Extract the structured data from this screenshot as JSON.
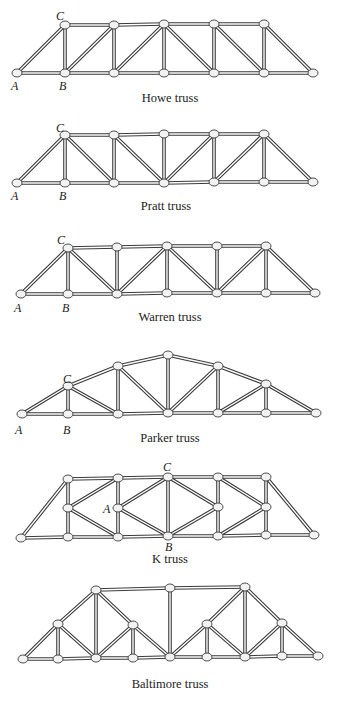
{
  "figure": {
    "trusses": [
      {
        "name": "Howe truss",
        "title_pos": [
          170,
          92
        ],
        "labels": [
          {
            "text": "C",
            "x": 56,
            "y": 10
          },
          {
            "text": "A",
            "x": 11,
            "y": 80
          },
          {
            "text": "B",
            "x": 59,
            "y": 80
          }
        ],
        "nodes": [
          [
            17,
            73
          ],
          [
            65,
            73
          ],
          [
            114,
            73
          ],
          [
            164,
            73
          ],
          [
            214,
            73
          ],
          [
            264,
            73
          ],
          [
            313,
            73
          ],
          [
            65,
            25
          ],
          [
            114,
            25
          ],
          [
            164,
            24
          ],
          [
            214,
            24
          ],
          [
            264,
            24
          ]
        ],
        "members": [
          [
            0,
            1
          ],
          [
            1,
            2
          ],
          [
            2,
            3
          ],
          [
            3,
            4
          ],
          [
            4,
            5
          ],
          [
            5,
            6
          ],
          [
            7,
            8
          ],
          [
            8,
            9
          ],
          [
            9,
            10
          ],
          [
            10,
            11
          ],
          [
            0,
            7
          ],
          [
            11,
            6
          ],
          [
            1,
            7
          ],
          [
            2,
            8
          ],
          [
            3,
            9
          ],
          [
            4,
            10
          ],
          [
            5,
            11
          ],
          [
            1,
            8
          ],
          [
            2,
            9
          ],
          [
            9,
            4
          ],
          [
            10,
            5
          ]
        ]
      },
      {
        "name": "Pratt truss",
        "title_pos": [
          166,
          200
        ],
        "labels": [
          {
            "text": "C",
            "x": 56,
            "y": 122
          },
          {
            "text": "A",
            "x": 11,
            "y": 190
          },
          {
            "text": "B",
            "x": 59,
            "y": 190
          }
        ],
        "nodes": [
          [
            17,
            183
          ],
          [
            65,
            183
          ],
          [
            114,
            183
          ],
          [
            164,
            183
          ],
          [
            214,
            182
          ],
          [
            264,
            182
          ],
          [
            313,
            182
          ],
          [
            65,
            135
          ],
          [
            114,
            135
          ],
          [
            164,
            134
          ],
          [
            214,
            134
          ],
          [
            264,
            134
          ]
        ],
        "members": [
          [
            0,
            1
          ],
          [
            1,
            2
          ],
          [
            2,
            3
          ],
          [
            3,
            4
          ],
          [
            4,
            5
          ],
          [
            5,
            6
          ],
          [
            7,
            8
          ],
          [
            8,
            9
          ],
          [
            9,
            10
          ],
          [
            10,
            11
          ],
          [
            0,
            7
          ],
          [
            11,
            6
          ],
          [
            1,
            7
          ],
          [
            2,
            8
          ],
          [
            3,
            9
          ],
          [
            4,
            10
          ],
          [
            5,
            11
          ],
          [
            7,
            2
          ],
          [
            8,
            3
          ],
          [
            3,
            10
          ],
          [
            4,
            11
          ]
        ]
      },
      {
        "name": "Warren truss",
        "title_pos": [
          170,
          311
        ],
        "labels": [
          {
            "text": "C",
            "x": 57,
            "y": 234
          },
          {
            "text": "A",
            "x": 14,
            "y": 302
          },
          {
            "text": "B",
            "x": 62,
            "y": 302
          }
        ],
        "nodes": [
          [
            21,
            294
          ],
          [
            68,
            294
          ],
          [
            117,
            294
          ],
          [
            167,
            293
          ],
          [
            217,
            293
          ],
          [
            266,
            293
          ],
          [
            315,
            293
          ],
          [
            68,
            248
          ],
          [
            117,
            247
          ],
          [
            167,
            246
          ],
          [
            217,
            246
          ],
          [
            266,
            246
          ]
        ],
        "members": [
          [
            0,
            1
          ],
          [
            1,
            2
          ],
          [
            2,
            3
          ],
          [
            3,
            4
          ],
          [
            4,
            5
          ],
          [
            5,
            6
          ],
          [
            7,
            8
          ],
          [
            8,
            9
          ],
          [
            9,
            10
          ],
          [
            10,
            11
          ],
          [
            0,
            7
          ],
          [
            11,
            6
          ],
          [
            1,
            7
          ],
          [
            2,
            8
          ],
          [
            3,
            9
          ],
          [
            4,
            10
          ],
          [
            5,
            11
          ],
          [
            7,
            2
          ],
          [
            2,
            9
          ],
          [
            9,
            4
          ],
          [
            4,
            11
          ]
        ]
      },
      {
        "name": "Parker truss",
        "title_pos": [
          170,
          432
        ],
        "labels": [
          {
            "text": "C",
            "x": 63,
            "y": 373
          },
          {
            "text": "A",
            "x": 15,
            "y": 424
          },
          {
            "text": "B",
            "x": 63,
            "y": 424
          }
        ],
        "nodes": [
          [
            22,
            414
          ],
          [
            68,
            414
          ],
          [
            118,
            414
          ],
          [
            168,
            413
          ],
          [
            218,
            413
          ],
          [
            266,
            413
          ],
          [
            316,
            413
          ],
          [
            68,
            386
          ],
          [
            118,
            366
          ],
          [
            168,
            355
          ],
          [
            218,
            366
          ],
          [
            266,
            384
          ]
        ],
        "members": [
          [
            0,
            1
          ],
          [
            1,
            2
          ],
          [
            2,
            3
          ],
          [
            3,
            4
          ],
          [
            4,
            5
          ],
          [
            5,
            6
          ],
          [
            7,
            8
          ],
          [
            8,
            9
          ],
          [
            9,
            10
          ],
          [
            10,
            11
          ],
          [
            0,
            7
          ],
          [
            11,
            6
          ],
          [
            1,
            7
          ],
          [
            2,
            8
          ],
          [
            3,
            9
          ],
          [
            4,
            10
          ],
          [
            5,
            11
          ],
          [
            7,
            2
          ],
          [
            8,
            3
          ],
          [
            10,
            3
          ],
          [
            11,
            4
          ]
        ]
      },
      {
        "name": "K truss",
        "title_pos": [
          170,
          553
        ],
        "labels": [
          {
            "text": "C",
            "x": 163,
            "y": 461
          },
          {
            "text": "A",
            "x": 103,
            "y": 503
          },
          {
            "text": "B",
            "x": 165,
            "y": 541
          }
        ],
        "nodes": [
          [
            21,
            538
          ],
          [
            68,
            537
          ],
          [
            118,
            537
          ],
          [
            168,
            536
          ],
          [
            218,
            536
          ],
          [
            266,
            535
          ],
          [
            314,
            535
          ],
          [
            68,
            479
          ],
          [
            118,
            478
          ],
          [
            168,
            477
          ],
          [
            218,
            477
          ],
          [
            266,
            477
          ],
          [
            68,
            508
          ],
          [
            118,
            508
          ],
          [
            218,
            507
          ],
          [
            266,
            507
          ]
        ],
        "members": [
          [
            0,
            1
          ],
          [
            1,
            2
          ],
          [
            2,
            3
          ],
          [
            3,
            4
          ],
          [
            4,
            5
          ],
          [
            5,
            6
          ],
          [
            7,
            8
          ],
          [
            8,
            9
          ],
          [
            9,
            10
          ],
          [
            10,
            11
          ],
          [
            0,
            7
          ],
          [
            11,
            6
          ],
          [
            1,
            12
          ],
          [
            12,
            7
          ],
          [
            2,
            13
          ],
          [
            13,
            8
          ],
          [
            3,
            9
          ],
          [
            4,
            14
          ],
          [
            14,
            10
          ],
          [
            5,
            15
          ],
          [
            15,
            11
          ],
          [
            12,
            8
          ],
          [
            12,
            2
          ],
          [
            13,
            9
          ],
          [
            13,
            3
          ],
          [
            9,
            14
          ],
          [
            3,
            14
          ],
          [
            10,
            15
          ],
          [
            4,
            15
          ]
        ]
      },
      {
        "name": "Baltimore truss",
        "title_pos": [
          170,
          678
        ],
        "labels": [],
        "nodes": [
          [
            23,
            659
          ],
          [
            58,
            659
          ],
          [
            96,
            658
          ],
          [
            133,
            658
          ],
          [
            170,
            657
          ],
          [
            207,
            657
          ],
          [
            245,
            657
          ],
          [
            282,
            656
          ],
          [
            318,
            656
          ],
          [
            96,
            590
          ],
          [
            170,
            588
          ],
          [
            245,
            587
          ],
          [
            58,
            624
          ],
          [
            133,
            625
          ],
          [
            207,
            624
          ],
          [
            282,
            623
          ]
        ],
        "members": [
          [
            0,
            1
          ],
          [
            1,
            2
          ],
          [
            2,
            3
          ],
          [
            3,
            4
          ],
          [
            4,
            5
          ],
          [
            5,
            6
          ],
          [
            6,
            7
          ],
          [
            7,
            8
          ],
          [
            9,
            10
          ],
          [
            10,
            11
          ],
          [
            0,
            12
          ],
          [
            12,
            9
          ],
          [
            9,
            13
          ],
          [
            13,
            4
          ],
          [
            4,
            14
          ],
          [
            14,
            11
          ],
          [
            11,
            15
          ],
          [
            15,
            8
          ],
          [
            1,
            12
          ],
          [
            2,
            9
          ],
          [
            3,
            13
          ],
          [
            4,
            10
          ],
          [
            5,
            14
          ],
          [
            6,
            11
          ],
          [
            7,
            15
          ],
          [
            12,
            2
          ],
          [
            13,
            2
          ],
          [
            14,
            6
          ],
          [
            15,
            6
          ]
        ]
      }
    ]
  }
}
